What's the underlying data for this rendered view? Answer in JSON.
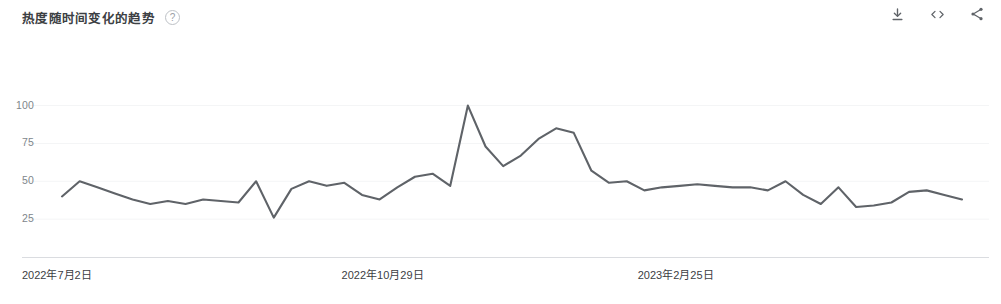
{
  "header": {
    "title": "热度随时间变化的趋势",
    "help_icon_label": "?",
    "actions": [
      {
        "name": "download-icon",
        "label": "下载"
      },
      {
        "name": "embed-icon",
        "label": "嵌入"
      },
      {
        "name": "share-icon",
        "label": "分享"
      }
    ]
  },
  "colors": {
    "line": "#5f6368",
    "axis": "#dadce0",
    "tick_text": "#80868b",
    "label_text": "#3c4043",
    "background": "#ffffff"
  },
  "chart_data": {
    "type": "line",
    "title": "热度随时间变化的趋势",
    "xlabel": "",
    "ylabel": "",
    "ylim": [
      0,
      105
    ],
    "yticks": [
      25,
      50,
      75,
      100
    ],
    "ytick_labels": [
      "25",
      "50",
      "75",
      "100"
    ],
    "grid": false,
    "legend": "none",
    "xtick_labels": [
      "2022年7月2日",
      "2022年10月29日",
      "2023年2月25日"
    ],
    "xtick_positions": [
      0,
      0.34,
      0.655
    ],
    "x": [
      "2022年7月2日",
      "2022年7月9日",
      "2022年7月16日",
      "2022年7月23日",
      "2022年7月30日",
      "2022年8月6日",
      "2022年8月13日",
      "2022年8月20日",
      "2022年8月27日",
      "2022年9月3日",
      "2022年9月10日",
      "2022年9月17日",
      "2022年9月24日",
      "2022年10月1日",
      "2022年10月8日",
      "2022年10月15日",
      "2022年10月22日",
      "2022年10月29日",
      "2022年11月5日",
      "2022年11月12日",
      "2022年11月19日",
      "2022年11月26日",
      "2022年12月3日",
      "2022年12月10日",
      "2022年12月17日",
      "2022年12月24日",
      "2022年12月31日",
      "2023年1月7日",
      "2023年1月14日",
      "2023年1月21日",
      "2023年1月28日",
      "2023年2月4日",
      "2023年2月11日",
      "2023年2月18日",
      "2023年2月25日",
      "2023年3月4日",
      "2023年3月11日",
      "2023年3月18日",
      "2023年3月25日",
      "2023年4月1日",
      "2023年4月8日",
      "2023年4月15日",
      "2023年4月22日",
      "2023年4月29日",
      "2023年5月6日",
      "2023年5月13日",
      "2023年5月20日",
      "2023年5月27日",
      "2023年6月3日",
      "2023年6月10日",
      "2023年6月17日",
      "2023年6月24日"
    ],
    "values": [
      40,
      50,
      46,
      42,
      38,
      35,
      37,
      35,
      38,
      37,
      36,
      50,
      26,
      45,
      50,
      47,
      49,
      41,
      38,
      46,
      53,
      55,
      47,
      100,
      73,
      60,
      67,
      78,
      85,
      82,
      57,
      49,
      50,
      44,
      46,
      47,
      48,
      47,
      46,
      46,
      44,
      50,
      41,
      35,
      46,
      33,
      34,
      36,
      43,
      44,
      41,
      38
    ],
    "series_name": "热度",
    "y_max_value": 100,
    "y_min_value": 26
  }
}
